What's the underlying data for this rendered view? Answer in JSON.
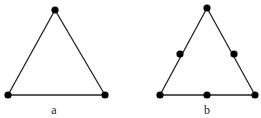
{
  "figures": [
    {
      "label": "a",
      "vertices": [
        [
          55,
          10
        ],
        [
          8,
          95
        ],
        [
          105,
          95
        ]
      ],
      "nodes": [
        [
          55,
          10
        ],
        [
          8,
          95
        ],
        [
          105,
          95
        ]
      ],
      "label_pos": [
        54,
        103
      ]
    },
    {
      "label": "b",
      "vertices": [
        [
          207,
          8
        ],
        [
          160,
          95
        ],
        [
          255,
          95
        ]
      ],
      "nodes": [
        [
          207,
          8
        ],
        [
          160,
          95
        ],
        [
          255,
          95
        ],
        [
          180,
          54
        ],
        [
          234,
          54
        ],
        [
          207,
          95
        ]
      ],
      "label_pos": [
        207,
        103
      ]
    }
  ],
  "colors": {
    "stroke": "#222222",
    "node": "#000000"
  }
}
